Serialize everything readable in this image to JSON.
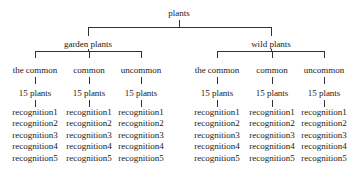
{
  "root": {
    "label": "plants"
  },
  "groups": [
    {
      "label": "garden plants",
      "children": [
        {
          "label": "the common",
          "count": "15 plants",
          "items": [
            "recognition1",
            "recognition2",
            "recognition3",
            "recognition4",
            "recognition5"
          ]
        },
        {
          "label": "common",
          "count": "15 plants",
          "items": [
            "recognition1",
            "recognition2",
            "recognition3",
            "recognition4",
            "recognition5"
          ]
        },
        {
          "label": "uncommon",
          "count": "15 plants",
          "items": [
            "recognition1",
            "recognition2",
            "recognition3",
            "recognition4",
            "recognition5"
          ]
        }
      ]
    },
    {
      "label": "wild plants",
      "children": [
        {
          "label": "the common",
          "count": "15 plants",
          "items": [
            "recognition1",
            "recognition2",
            "recognition3",
            "recognition4",
            "recognition5"
          ]
        },
        {
          "label": "common",
          "count": "15 plants",
          "items": [
            "recognition1",
            "recognition2",
            "recognition3",
            "recognition4",
            "recognition5"
          ]
        },
        {
          "label": "uncommon",
          "count": "15 plants",
          "items": [
            "recognition1",
            "recognition2",
            "recognition3",
            "recognition4",
            "recognition5"
          ]
        }
      ]
    }
  ]
}
